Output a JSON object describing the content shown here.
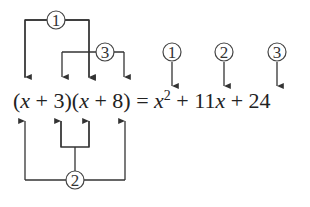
{
  "equation": {
    "lhs": {
      "open1": "(",
      "x1": "x",
      "plus1": " + 3)(",
      "x2": "x",
      "plus2": " + 8) = "
    },
    "rhs": {
      "x_sq": "x",
      "exp": "2",
      "mid": " + 11",
      "x_lin": "x",
      "end": " + 24"
    },
    "full_text": "(x + 3)(x + 8) = x^2 + 11x + 24"
  },
  "steps": [
    {
      "label": "1",
      "description": "First terms: x · x",
      "result": "x^2"
    },
    {
      "label": "2",
      "description": "Outer + inner: 8x + 3x",
      "result": "11x"
    },
    {
      "label": "3",
      "description": "Last terms: 3 · 8",
      "result": "24"
    }
  ],
  "colors": {
    "line": "#333333",
    "text": "#222222",
    "background": "#ffffff"
  }
}
